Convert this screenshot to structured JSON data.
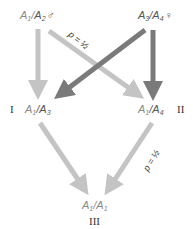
{
  "nodes": {
    "top_left": {
      "a": "A",
      "a_sub": "1",
      "sep": "/",
      "b": "A",
      "b_sub": "2",
      "symbol": "♂"
    },
    "top_right": {
      "a": "A",
      "a_sub": "3",
      "sep": "/",
      "b": "A",
      "b_sub": "4",
      "symbol": "♀"
    },
    "mid_left": {
      "a": "A",
      "a_sub": "1",
      "sep": "/",
      "b": "A",
      "b_sub": "3",
      "roman": "I"
    },
    "mid_right": {
      "a": "A",
      "a_sub": "1",
      "sep": "/",
      "b": "A",
      "b_sub": "4",
      "roman": "II"
    },
    "bottom": {
      "a": "A",
      "a_sub": "1",
      "sep": "/",
      "b": "A",
      "b_sub": "1",
      "roman": "III"
    }
  },
  "labels": {
    "p_top": "p = ½",
    "p_bottom": "p = ½"
  },
  "colors": {
    "light_arrow": "#c4c4c4",
    "dark_arrow": "#7a7a7a"
  }
}
